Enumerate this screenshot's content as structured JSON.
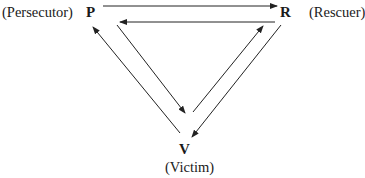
{
  "diagram": {
    "nodes": [
      {
        "id": "P",
        "letter": "P",
        "role": "(Persecutor)"
      },
      {
        "id": "R",
        "letter": "R",
        "role": "(Rescuer)"
      },
      {
        "id": "V",
        "letter": "V",
        "role": "(Victim)"
      }
    ],
    "edges": [
      {
        "from": "P",
        "to": "R"
      },
      {
        "from": "R",
        "to": "P"
      },
      {
        "from": "V",
        "to": "P"
      },
      {
        "from": "P",
        "to": "V"
      },
      {
        "from": "V",
        "to": "R"
      },
      {
        "from": "R",
        "to": "V"
      }
    ],
    "line_color": "#222222"
  }
}
